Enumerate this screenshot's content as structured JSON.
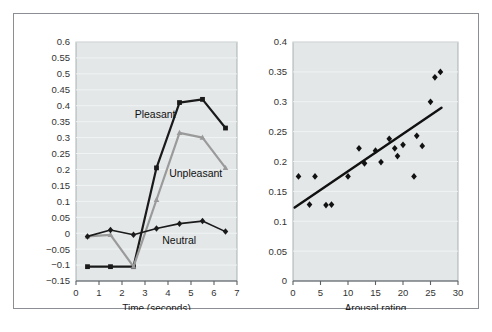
{
  "figure": {
    "border_color": "#8b8f94",
    "background": "#ffffff",
    "plot_background": "#e3e7e8",
    "gridline_color": "#f2f5f5"
  },
  "chart_data": [
    {
      "id": "left",
      "type": "line",
      "title": "",
      "xlabel": "Time (seconds)",
      "ylabel": "",
      "xlim": [
        0,
        7
      ],
      "ylim": [
        -0.15,
        0.6
      ],
      "xticks": [
        0,
        1,
        2,
        3,
        4,
        5,
        6,
        7
      ],
      "xtick_labels": [
        "0",
        "1",
        "2",
        "3",
        "4",
        "5",
        "6",
        "7"
      ],
      "yticks": [
        -0.15,
        -0.1,
        -0.05,
        0,
        0.05,
        0.1,
        0.15,
        0.2,
        0.25,
        0.3,
        0.35,
        0.4,
        0.45,
        0.5,
        0.55,
        0.6
      ],
      "ytick_labels": [
        "−0.15",
        "−0.1",
        "−0.05",
        "0",
        "0.05",
        "0.1",
        "0.15",
        "0.2",
        "0.25",
        "0.3",
        "0.35",
        "0.4",
        "0.45",
        "0.5",
        "0.55",
        "0.6"
      ],
      "grid": true,
      "legend": "inline-annotations",
      "x": [
        0.5,
        1.5,
        2.5,
        3.5,
        4.5,
        5.5,
        6.5
      ],
      "series": [
        {
          "name": "Pleasant",
          "color": "#1a1a1a",
          "marker": "square",
          "line_width": 2.2,
          "values": [
            -0.105,
            -0.105,
            -0.105,
            0.205,
            0.41,
            0.42,
            0.33
          ],
          "label_x": 2.55,
          "label_y": 0.36
        },
        {
          "name": "Unpleasant",
          "color": "#9a9a9a",
          "marker": "triangle",
          "line_width": 2.2,
          "values": [
            -0.01,
            -0.005,
            -0.105,
            0.105,
            0.315,
            0.3,
            0.205
          ],
          "label_x": 4.05,
          "label_y": 0.175
        },
        {
          "name": "Neutral",
          "color": "#1a1a1a",
          "marker": "diamond",
          "line_width": 1.6,
          "values": [
            -0.01,
            0.01,
            -0.005,
            0.015,
            0.03,
            0.038,
            0.005
          ],
          "label_x": 3.75,
          "label_y": -0.035
        }
      ]
    },
    {
      "id": "right",
      "type": "scatter",
      "title": "",
      "xlabel": "Arousal rating",
      "ylabel": "",
      "xlim": [
        0,
        30
      ],
      "ylim": [
        0,
        0.4
      ],
      "xticks": [
        0,
        5,
        10,
        15,
        20,
        25,
        30
      ],
      "xtick_labels": [
        "0",
        "5",
        "10",
        "15",
        "20",
        "25",
        "30"
      ],
      "yticks": [
        0,
        0.05,
        0.1,
        0.15,
        0.2,
        0.25,
        0.3,
        0.35,
        0.4
      ],
      "ytick_labels": [
        "0",
        "0.05",
        "0.1",
        "0.15",
        "0.2",
        "0.25",
        "0.3",
        "0.35",
        "0.4"
      ],
      "grid": true,
      "marker": "diamond",
      "marker_color": "#111111",
      "points": [
        {
          "x": 1,
          "y": 0.175
        },
        {
          "x": 3,
          "y": 0.128
        },
        {
          "x": 4,
          "y": 0.175
        },
        {
          "x": 6,
          "y": 0.127
        },
        {
          "x": 7,
          "y": 0.128
        },
        {
          "x": 10,
          "y": 0.175
        },
        {
          "x": 12,
          "y": 0.222
        },
        {
          "x": 13,
          "y": 0.197
        },
        {
          "x": 15,
          "y": 0.218
        },
        {
          "x": 16,
          "y": 0.199
        },
        {
          "x": 17.5,
          "y": 0.238
        },
        {
          "x": 18.5,
          "y": 0.222
        },
        {
          "x": 19,
          "y": 0.209
        },
        {
          "x": 20,
          "y": 0.228
        },
        {
          "x": 22,
          "y": 0.175
        },
        {
          "x": 22.5,
          "y": 0.243
        },
        {
          "x": 23.5,
          "y": 0.226
        },
        {
          "x": 25,
          "y": 0.3
        },
        {
          "x": 25.8,
          "y": 0.341
        },
        {
          "x": 26.8,
          "y": 0.35
        }
      ],
      "trendline": {
        "x_start": 0.3,
        "y_start": 0.123,
        "x_end": 27.0,
        "y_end": 0.29,
        "color": "#111111",
        "width": 2.4
      }
    }
  ]
}
